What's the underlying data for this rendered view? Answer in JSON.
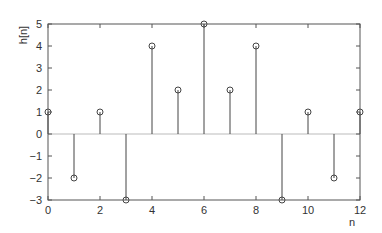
{
  "chart_data": {
    "type": "stem",
    "title": "",
    "xlabel": "n",
    "ylabel": "h[n]",
    "x": [
      0,
      1,
      2,
      3,
      4,
      5,
      6,
      7,
      8,
      9,
      10,
      11,
      12
    ],
    "values": [
      1,
      -2,
      1,
      -3,
      4,
      2,
      5,
      2,
      4,
      -3,
      1,
      -2,
      1
    ],
    "xlim": [
      0,
      12
    ],
    "ylim": [
      -3,
      5
    ],
    "xticks": [
      0,
      2,
      4,
      6,
      8,
      10,
      12
    ],
    "yticks": [
      -3,
      -2,
      -1,
      0,
      1,
      2,
      3,
      4,
      5
    ],
    "grid": false,
    "zero_line": true,
    "marker": "open-circle",
    "colors": {
      "stem": "#444444",
      "axis": "#555555",
      "zero_line": "#bbbbbb",
      "text": "#333333"
    }
  },
  "plot_area": {
    "left": 48,
    "right": 360,
    "top": 24,
    "bottom": 200
  }
}
